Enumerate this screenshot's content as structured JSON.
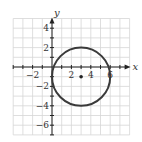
{
  "graph": {
    "axes": {
      "x_label": "x",
      "y_label": "y",
      "x_range": [
        -4,
        8
      ],
      "y_range": [
        -7,
        5
      ]
    },
    "x_ticks": [
      {
        "value": -2,
        "label": "−2"
      },
      {
        "value": 2,
        "label": "2"
      },
      {
        "value": 4,
        "label": "4"
      },
      {
        "value": 6,
        "label": "6"
      }
    ],
    "y_ticks": [
      {
        "value": 4,
        "label": "4"
      },
      {
        "value": 2,
        "label": "2"
      },
      {
        "value": -2,
        "label": "−2"
      },
      {
        "value": -4,
        "label": "−4"
      },
      {
        "value": -6,
        "label": "−6"
      }
    ],
    "circle": {
      "center_x": 3,
      "center_y": -1,
      "radius": 3
    },
    "center_point": {
      "x": 3,
      "y": -1
    },
    "colors": {
      "grid": "#d6d6d6",
      "axis": "#222222",
      "curve": "#333333"
    }
  }
}
